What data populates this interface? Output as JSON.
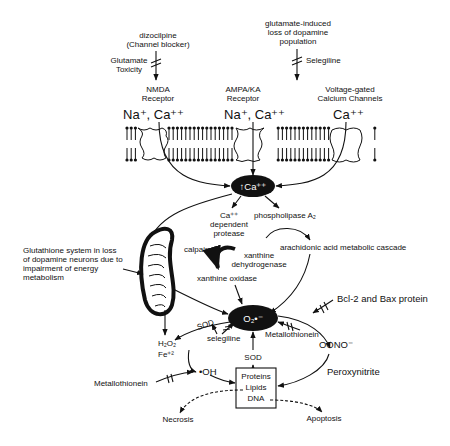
{
  "top": {
    "dizocilpine": [
      "dizocilpine",
      "(Channel blocker)"
    ],
    "glutamate_toxicity": [
      "Glutamate",
      "Toxicity"
    ],
    "glutamate_loss": [
      "glutamate-induced",
      "loss of dopamine",
      "population"
    ],
    "selegiline_top": "Selegiline"
  },
  "receptors": {
    "nmda": [
      "NMDA",
      "Receptor"
    ],
    "ampa": [
      "AMPA/KA",
      "Receptor"
    ],
    "vgcc": [
      "Voltage-gated",
      "Calcium Channels"
    ]
  },
  "ions": {
    "nmda": "Na⁺, Ca⁺⁺",
    "ampa": "Na⁺, Ca⁺⁺",
    "vgcc": "Ca⁺⁺"
  },
  "nodes": {
    "calcium": "↑Ca⁺⁺",
    "superoxide": "O₂•⁻",
    "ca_protease": [
      "Ca⁺⁺",
      "dependent",
      "protease"
    ],
    "phospholipase": "phospholipase A₂",
    "arachidonic": "arachidonic acid metabolic cascade",
    "calpain": "calpain",
    "xanthine_dh": [
      "xanthine",
      "dehydrogenase"
    ],
    "xanthine_ox": "xanthine oxidase",
    "glutathione": [
      "Glutathione system in loss",
      "of dopamine neurons due to",
      "impairment of energy",
      "metabolism"
    ],
    "bcl2": "Bcl-2 and Bax protein",
    "sod_left": "SOD",
    "sod_mid": "SOD",
    "selegiline_mid": "selegiline",
    "metallothionein_right": "Metallothionein",
    "h2o2": "H₂O₂",
    "fe2": "Fe⁺²",
    "oh": "•OH",
    "metallothionein_left": "Metallothionein",
    "oono": "OONO⁻",
    "peroxynitrite": "Peroxynitrite",
    "targets": [
      "Proteins",
      "Lipids",
      "DNA"
    ],
    "necrosis": "Necrosis",
    "apoptosis": "Apoptosis"
  },
  "colors": {
    "ink": "#111111",
    "background": "#ffffff"
  }
}
